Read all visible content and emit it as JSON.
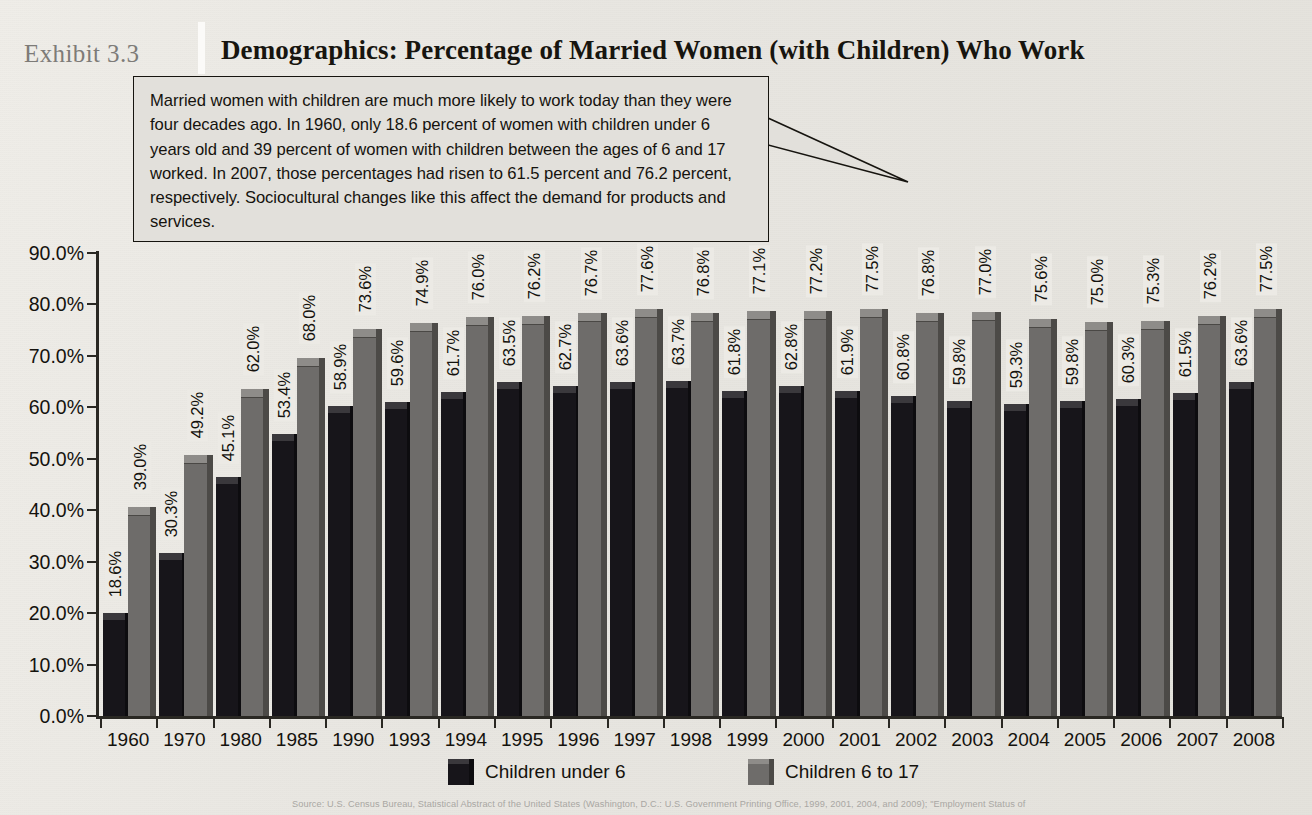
{
  "header": {
    "exhibit_number": "Exhibit 3.3",
    "title": "Demographics: Percentage of Married Women (with Children) Who Work"
  },
  "callout": {
    "text": "Married women with children are much more likely to work today than they were four decades ago. In 1960, only 18.6 percent of women with children under 6 years old and 39 percent of women with children between the ages of 6 and 17 worked. In 2007, those percentages had risen to 61.5 percent and 76.2 percent, respectively. Sociocultural changes like this affect the demand for products and services."
  },
  "source": {
    "text": "Source: U.S. Census Bureau, Statistical Abstract of the United States (Washington, D.C.: U.S. Government Printing Office, 1999, 2001, 2004, and 2009); \"Employment Status of"
  },
  "colors": {
    "series_under6": "#17151a",
    "series_6to17": "#6e6c6a",
    "background": "#e9e7e2",
    "axis": "#2a2823",
    "text": "#14120d",
    "exhibit_number": "#7d7b78"
  },
  "chart_data": {
    "type": "bar",
    "title": "Demographics: Percentage of Married Women (with Children) Who Work",
    "xlabel": "",
    "ylabel": "",
    "ylim": [
      0,
      90
    ],
    "ytick_labels": [
      "0.0%",
      "10.0%",
      "20.0%",
      "30.0%",
      "40.0%",
      "50.0%",
      "60.0%",
      "70.0%",
      "80.0%",
      "90.0%"
    ],
    "ytick_values": [
      0,
      10,
      20,
      30,
      40,
      50,
      60,
      70,
      80,
      90
    ],
    "grid": false,
    "legend_position": "bottom",
    "categories": [
      "1960",
      "1970",
      "1980",
      "1985",
      "1990",
      "1993",
      "1994",
      "1995",
      "1996",
      "1997",
      "1998",
      "1999",
      "2000",
      "2001",
      "2002",
      "2003",
      "2004",
      "2005",
      "2006",
      "2007",
      "2008"
    ],
    "series": [
      {
        "name": "Children under 6",
        "color": "#17151a",
        "values": [
          18.6,
          30.3,
          45.1,
          53.4,
          58.9,
          59.6,
          61.7,
          63.5,
          62.7,
          63.6,
          63.7,
          61.8,
          62.8,
          61.9,
          60.8,
          59.8,
          59.3,
          59.8,
          60.3,
          61.5,
          63.6
        ],
        "labels": [
          "18.6%",
          "30.3%",
          "45.1%",
          "53.4%",
          "58.9%",
          "59.6%",
          "61.7%",
          "63.5%",
          "62.7%",
          "63.6%",
          "63.7%",
          "61.8%",
          "62.8%",
          "61.9%",
          "60.8%",
          "59.8%",
          "59.3%",
          "59.8%",
          "60.3%",
          "61.5%",
          "63.6%"
        ]
      },
      {
        "name": "Children 6 to 17",
        "color": "#6e6c6a",
        "values": [
          39.0,
          49.2,
          62.0,
          68.0,
          73.6,
          74.9,
          76.0,
          76.2,
          76.7,
          77.6,
          76.8,
          77.1,
          77.2,
          77.5,
          76.8,
          77.0,
          75.6,
          75.0,
          75.3,
          76.2,
          77.5
        ],
        "labels": [
          "39.0%",
          "49.2%",
          "62.0%",
          "68.0%",
          "73.6%",
          "74.9%",
          "76.0%",
          "76.2%",
          "76.7%",
          "77.6%",
          "76.8%",
          "77.1%",
          "77.2%",
          "77.5%",
          "76.8%",
          "77.0%",
          "75.6%",
          "75.0%",
          "75.3%",
          "76.2%",
          "77.5%"
        ]
      }
    ]
  }
}
